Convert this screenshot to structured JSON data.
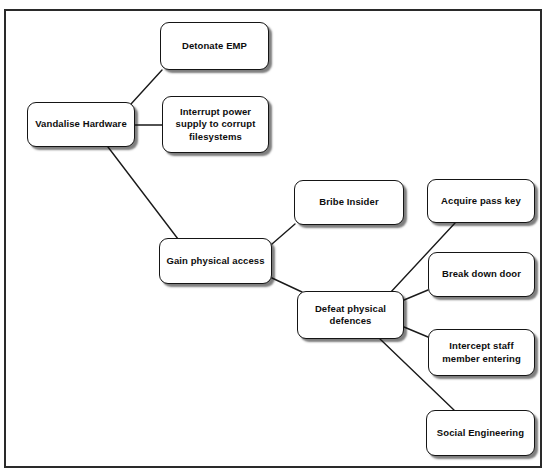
{
  "diagram": {
    "type": "attack-tree",
    "background_color": "#ffffff",
    "node_fill_color": "#ffffff",
    "node_border_color": "#151515",
    "edge_color": "#1a1a1a",
    "frame_color": "#2a2a2a",
    "nodes": [
      {
        "id": "vandalise-hardware",
        "label": "Vandalise Hardware",
        "x": 27,
        "y": 102,
        "w": 108,
        "h": 45
      },
      {
        "id": "detonate-emp",
        "label": "Detonate EMP",
        "x": 160,
        "y": 22,
        "w": 109,
        "h": 48
      },
      {
        "id": "interrupt-power-supply",
        "label": "Interrupt power supply to corrupt filesystems",
        "x": 162,
        "y": 96,
        "w": 107,
        "h": 57
      },
      {
        "id": "gain-physical-access",
        "label": "Gain physical access",
        "x": 159,
        "y": 238,
        "w": 113,
        "h": 46
      },
      {
        "id": "bribe-insider",
        "label": "Bribe Insider",
        "x": 294,
        "y": 180,
        "w": 110,
        "h": 45
      },
      {
        "id": "defeat-physical-defences",
        "label": "Defeat physical defences",
        "x": 297,
        "y": 291,
        "w": 107,
        "h": 48
      },
      {
        "id": "acquire-pass-key",
        "label": "Acquire pass key",
        "x": 427,
        "y": 179,
        "w": 108,
        "h": 44
      },
      {
        "id": "break-down-door",
        "label": "Break down door",
        "x": 428,
        "y": 252,
        "w": 107,
        "h": 45
      },
      {
        "id": "intercept-staff-member",
        "label": "Intercept staff member entering",
        "x": 428,
        "y": 329,
        "w": 107,
        "h": 47
      },
      {
        "id": "social-engineering",
        "label": "Social Engineering",
        "x": 426,
        "y": 410,
        "w": 109,
        "h": 46
      }
    ],
    "edges": [
      {
        "id": "edge-vandalise-detonate",
        "from": "vandalise-hardware",
        "to": "detonate-emp",
        "x1": 131,
        "y1": 104,
        "x2": 162,
        "y2": 70
      },
      {
        "id": "edge-vandalise-interrupt",
        "from": "vandalise-hardware",
        "to": "interrupt-power-supply",
        "x1": 135,
        "y1": 125,
        "x2": 162,
        "y2": 125
      },
      {
        "id": "edge-vandalise-gain-access",
        "from": "vandalise-hardware",
        "to": "gain-physical-access",
        "x1": 108,
        "y1": 147,
        "x2": 178,
        "y2": 239
      },
      {
        "id": "edge-gain-access-bribe",
        "from": "gain-physical-access",
        "to": "bribe-insider",
        "x1": 272,
        "y1": 244,
        "x2": 295,
        "y2": 224
      },
      {
        "id": "edge-gain-access-defeat",
        "from": "gain-physical-access",
        "to": "defeat-physical-defences",
        "x1": 272,
        "y1": 278,
        "x2": 302,
        "y2": 292
      },
      {
        "id": "edge-defeat-acquire-key",
        "from": "defeat-physical-defences",
        "to": "acquire-pass-key",
        "x1": 390,
        "y1": 293,
        "x2": 455,
        "y2": 223
      },
      {
        "id": "edge-defeat-break-door",
        "from": "defeat-physical-defences",
        "to": "break-down-door",
        "x1": 404,
        "y1": 300,
        "x2": 428,
        "y2": 290
      },
      {
        "id": "edge-defeat-intercept",
        "from": "defeat-physical-defences",
        "to": "intercept-staff-member",
        "x1": 404,
        "y1": 327,
        "x2": 428,
        "y2": 337
      },
      {
        "id": "edge-defeat-social-eng",
        "from": "defeat-physical-defences",
        "to": "social-engineering",
        "x1": 380,
        "y1": 339,
        "x2": 455,
        "y2": 411
      }
    ]
  }
}
